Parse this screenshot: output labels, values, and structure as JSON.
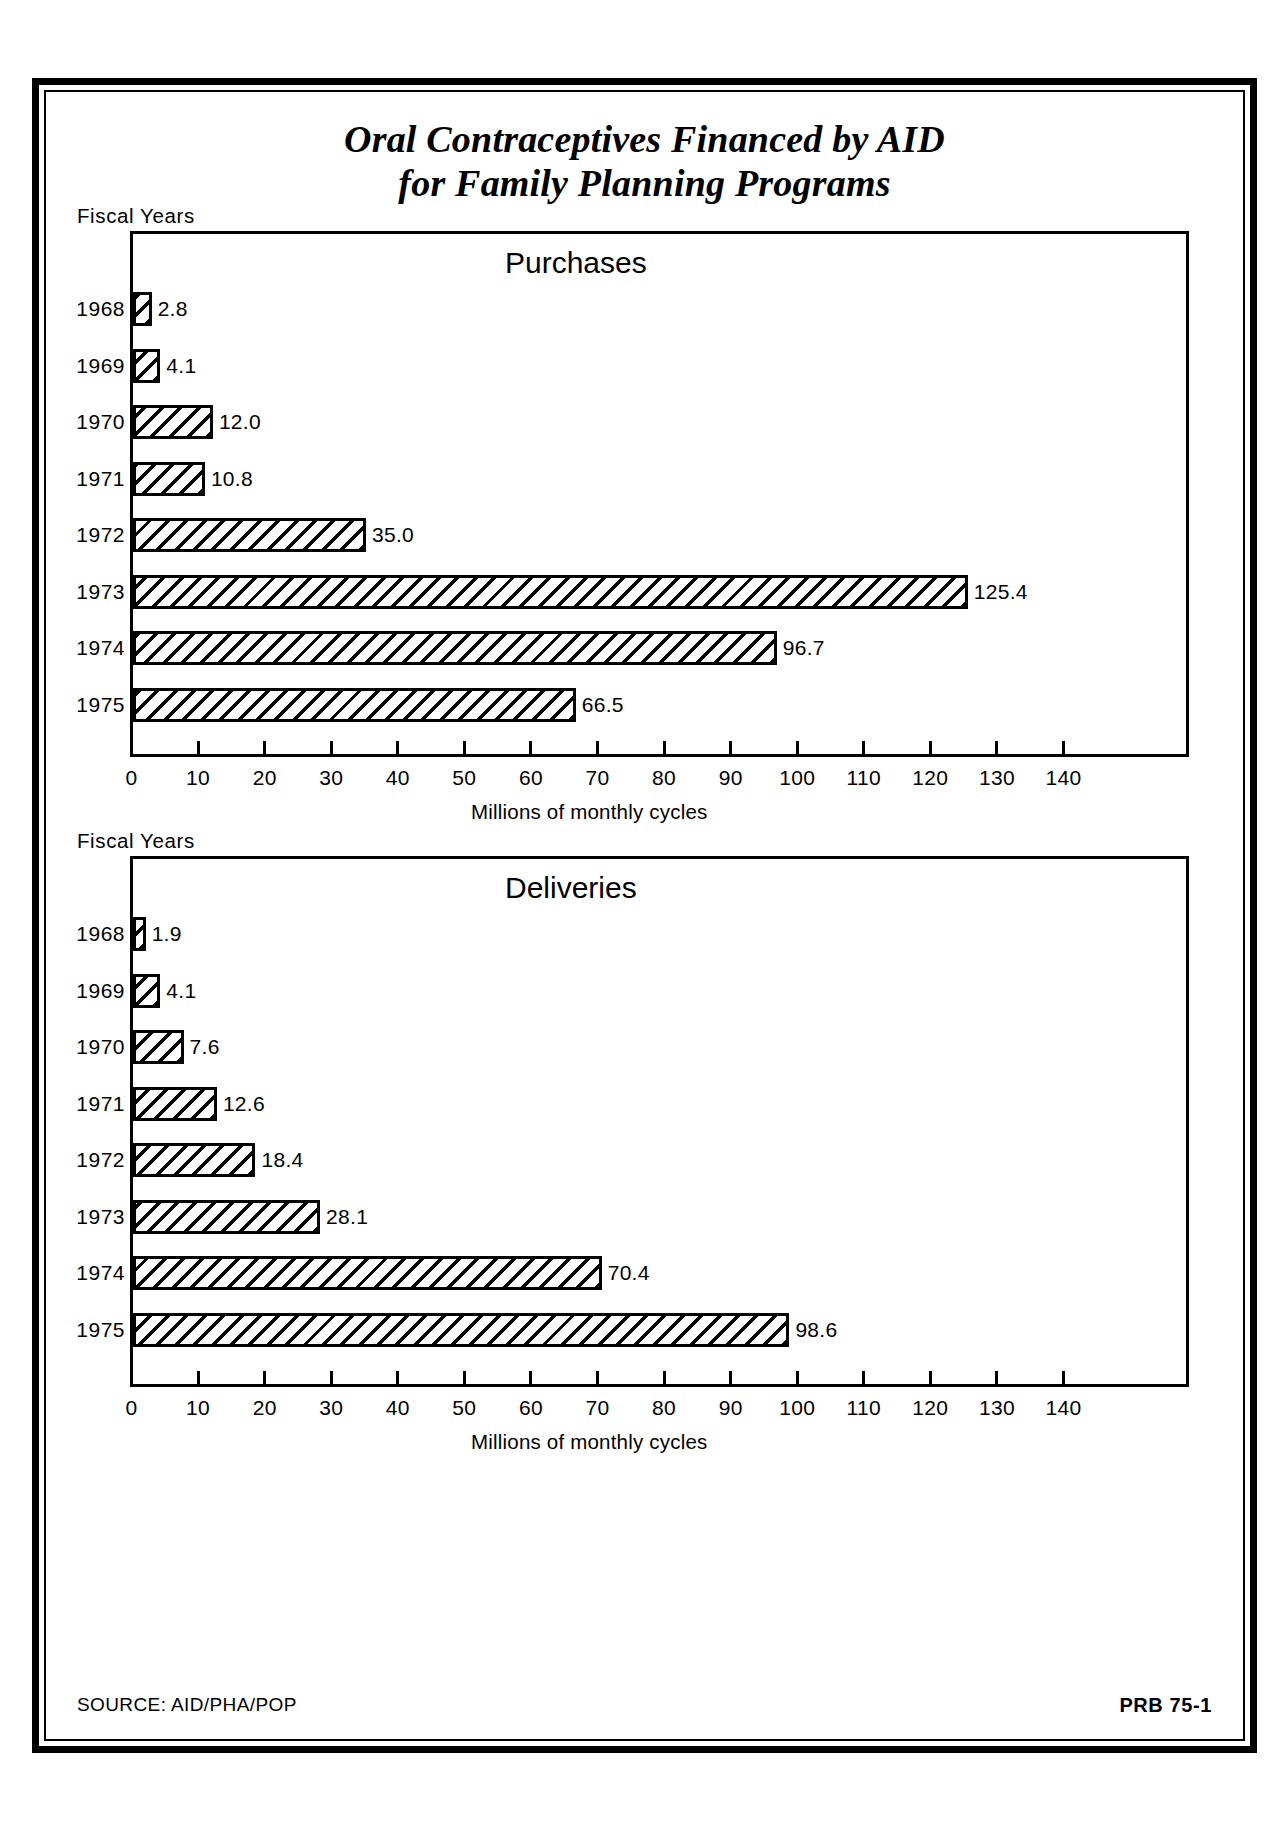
{
  "title": {
    "line1": "Oral Contraceptives Financed by AID",
    "line2": "for Family Planning Programs"
  },
  "footer": {
    "source": "SOURCE: AID/PHA/POP",
    "code": "PRB 75-1"
  },
  "labels": {
    "fiscal_years": "Fiscal Years",
    "axis_caption": "Millions of monthly cycles"
  },
  "chart_data": [
    {
      "type": "bar",
      "orientation": "horizontal",
      "title": "Purchases",
      "xlabel": "Millions of monthly cycles",
      "ylabel": "Fiscal Years",
      "xlim": [
        0,
        140
      ],
      "xticks": [
        0,
        10,
        20,
        30,
        40,
        50,
        60,
        70,
        80,
        90,
        100,
        110,
        120,
        130,
        140
      ],
      "grid": false,
      "legend": "none",
      "categories": [
        "1968",
        "1969",
        "1970",
        "1971",
        "1972",
        "1973",
        "1974",
        "1975"
      ],
      "values": [
        2.8,
        4.1,
        12.0,
        10.8,
        35.0,
        125.4,
        96.7,
        66.5
      ],
      "value_labels": [
        "2.8",
        "4.1",
        "12.0",
        "10.8",
        "35.0",
        "125.4",
        "96.7",
        "66.5"
      ]
    },
    {
      "type": "bar",
      "orientation": "horizontal",
      "title": "Deliveries",
      "xlabel": "Millions of monthly cycles",
      "ylabel": "Fiscal Years",
      "xlim": [
        0,
        140
      ],
      "xticks": [
        0,
        10,
        20,
        30,
        40,
        50,
        60,
        70,
        80,
        90,
        100,
        110,
        120,
        130,
        140
      ],
      "grid": false,
      "legend": "none",
      "categories": [
        "1968",
        "1969",
        "1970",
        "1971",
        "1972",
        "1973",
        "1974",
        "1975"
      ],
      "values": [
        1.9,
        4.1,
        7.6,
        12.6,
        18.4,
        28.1,
        70.4,
        98.6
      ],
      "value_labels": [
        "1.9",
        "4.1",
        "7.6",
        "12.6",
        "18.4",
        "28.1",
        "70.4",
        "98.6"
      ]
    }
  ]
}
